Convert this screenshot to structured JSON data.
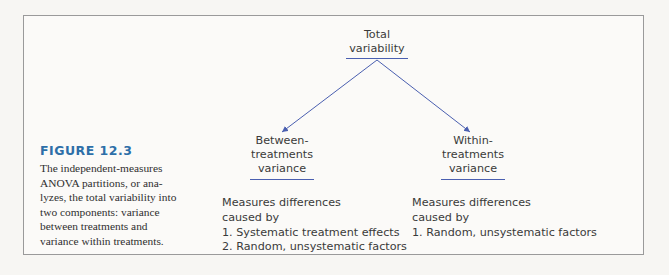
{
  "figure": {
    "label": "FIGURE 12.3",
    "caption_lines": [
      "The independent-measures",
      "ANOVA partitions, or ana-",
      "lyzes, the total variability into",
      "two components: variance",
      "between treatments and",
      "variance within treatments."
    ]
  },
  "diagram": {
    "root": {
      "lines": [
        "Total",
        "variability"
      ]
    },
    "children": [
      {
        "lines": [
          "Between-",
          "treatments",
          "variance"
        ],
        "description": [
          "Measures differences",
          "caused by",
          "1. Systematic treatment effects",
          "2. Random, unsystematic factors"
        ]
      },
      {
        "lines": [
          "Within-",
          "treatments",
          "variance"
        ],
        "description": [
          "Measures differences",
          "caused by",
          "1. Random, unsystematic factors"
        ]
      }
    ],
    "colors": {
      "arrow": "#4a5fb0",
      "figure_label": "#2d6fa8",
      "border": "#9a9a9a"
    }
  }
}
